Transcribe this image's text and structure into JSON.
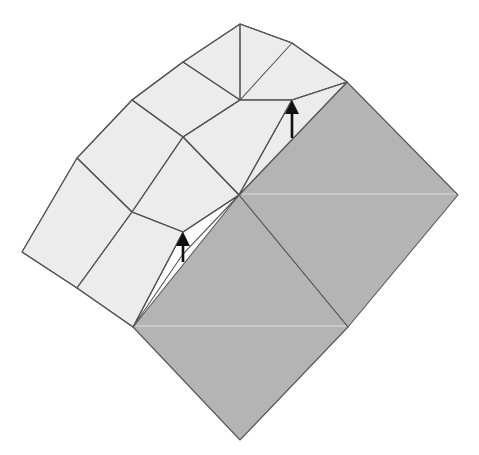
{
  "diagram": {
    "colors": {
      "light_paper": "#ececec",
      "dark_paper": "#b4b4b4",
      "outline": "#555555",
      "arrow": "#111111",
      "background": "#ffffff"
    },
    "dark_square": {
      "top": [
        347,
        82
      ],
      "right": [
        458,
        195
      ],
      "bottom": [
        240,
        440
      ],
      "left": [
        133,
        327
      ],
      "center": [
        239,
        195
      ],
      "right_mid": [
        348,
        327
      ]
    },
    "arrows": [
      {
        "name": "upper-arrow",
        "from": [
          292,
          138
        ],
        "to": [
          292,
          100
        ]
      },
      {
        "name": "lower-arrow",
        "from": [
          183,
          264
        ],
        "to": [
          183,
          232
        ]
      }
    ]
  }
}
